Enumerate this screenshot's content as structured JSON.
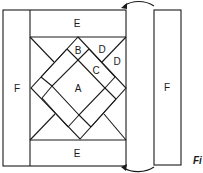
{
  "diagram": {
    "type": "quilt-block-assembly",
    "labels": {
      "center_square": "A",
      "corner_triangle": "B",
      "side_rectangle": "C",
      "outer_triangle_1": "D",
      "outer_triangle_2": "D",
      "top_border": "E",
      "bottom_border": "E",
      "left_border": "F",
      "right_border": "F"
    },
    "caption_fragment": "Fi",
    "colors": {
      "line": "#1a1a1a",
      "background": "#ffffff"
    }
  }
}
